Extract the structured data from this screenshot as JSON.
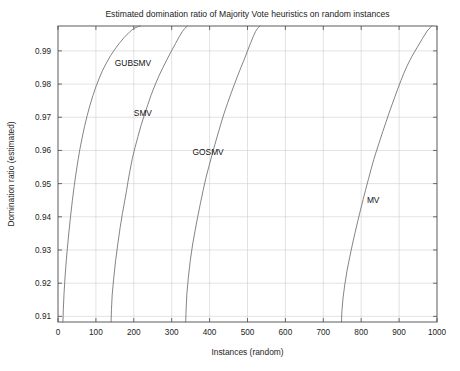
{
  "chart_data": {
    "type": "line",
    "title": "Estimated domination ratio of Majority Vote heuristics on random instances",
    "xlabel": "Instances (random)",
    "ylabel": "Domination ratio (estimated)",
    "xlim": [
      0,
      1000
    ],
    "ylim": [
      0.9083,
      0.9975
    ],
    "grid": true,
    "legend_position": "inline-annotations",
    "xticks": [
      0,
      100,
      200,
      300,
      400,
      500,
      600,
      700,
      800,
      900,
      1000
    ],
    "xtick_labels": [
      "0",
      "100",
      "200",
      "300",
      "400",
      "500",
      "600",
      "700",
      "800",
      "900",
      "1000"
    ],
    "yticks": [
      0.91,
      0.92,
      0.93,
      0.94,
      0.95,
      0.96,
      0.97,
      0.98,
      0.99
    ],
    "ytick_labels": [
      "0.91",
      "0.92",
      "0.93",
      "0.94",
      "0.95",
      "0.96",
      "0.97",
      "0.98",
      "0.99"
    ],
    "series": [
      {
        "name": "GUBSMV",
        "color": "#6e6e6e",
        "label_x": 150,
        "label_y": 0.9855,
        "x": [
          13,
          14,
          16,
          19,
          23,
          28,
          33,
          38,
          43,
          48,
          53,
          58,
          64,
          70,
          77,
          84,
          92,
          100,
          109,
          118,
          128,
          139,
          150,
          162,
          175,
          188,
          196,
          203,
          209,
          213,
          217
        ],
        "y": [
          0.9083,
          0.912,
          0.917,
          0.9225,
          0.9285,
          0.9345,
          0.94,
          0.945,
          0.9495,
          0.9535,
          0.9572,
          0.9605,
          0.964,
          0.9672,
          0.9705,
          0.9735,
          0.9765,
          0.9792,
          0.9818,
          0.9842,
          0.9864,
          0.9886,
          0.9905,
          0.9923,
          0.9941,
          0.9956,
          0.9964,
          0.9969,
          0.9972,
          0.9974,
          0.9975
        ]
      },
      {
        "name": "SMV",
        "color": "#636363",
        "label_x": 200,
        "label_y": 0.9705,
        "x": [
          140,
          141,
          143,
          147,
          152,
          158,
          164,
          170,
          176,
          181,
          185,
          190,
          196,
          203,
          211,
          219,
          228,
          237,
          246,
          256,
          266,
          277,
          288,
          299,
          310,
          320,
          328,
          334,
          338,
          341
        ],
        "y": [
          0.9083,
          0.912,
          0.9165,
          0.9215,
          0.9268,
          0.932,
          0.9368,
          0.941,
          0.9448,
          0.948,
          0.9508,
          0.954,
          0.9575,
          0.9608,
          0.9642,
          0.9675,
          0.9707,
          0.9738,
          0.9768,
          0.9797,
          0.9824,
          0.985,
          0.9875,
          0.9899,
          0.9922,
          0.9943,
          0.9958,
          0.9967,
          0.9972,
          0.9975
        ]
      },
      {
        "name": "GOSMV",
        "color": "#636363",
        "label_x": 355,
        "label_y": 0.9585,
        "x": [
          337,
          338,
          340,
          344,
          349,
          355,
          362,
          369,
          376,
          383,
          390,
          398,
          406,
          414,
          422,
          430,
          438,
          447,
          456,
          465,
          474,
          483,
          492,
          500,
          508,
          515,
          521,
          526,
          530,
          533
        ],
        "y": [
          0.9083,
          0.912,
          0.9168,
          0.9218,
          0.9268,
          0.9315,
          0.936,
          0.9402,
          0.9442,
          0.948,
          0.9516,
          0.9551,
          0.9585,
          0.9618,
          0.965,
          0.9681,
          0.9711,
          0.9741,
          0.977,
          0.9798,
          0.9825,
          0.9851,
          0.9876,
          0.99,
          0.9923,
          0.9943,
          0.9958,
          0.9967,
          0.9972,
          0.9975
        ]
      },
      {
        "name": "MV",
        "color": "#5f5f5f",
        "label_x": 815,
        "label_y": 0.9442,
        "x": [
          748,
          749,
          752,
          757,
          763,
          770,
          777,
          784,
          791,
          798,
          805,
          812,
          819,
          826,
          833,
          841,
          849,
          857,
          865,
          873,
          881,
          889,
          897,
          905,
          913,
          922,
          934,
          948,
          962,
          974,
          982,
          986
        ],
        "y": [
          0.9083,
          0.9115,
          0.9155,
          0.9198,
          0.924,
          0.928,
          0.9318,
          0.9353,
          0.9387,
          0.942,
          0.9452,
          0.9483,
          0.9513,
          0.9543,
          0.9572,
          0.9601,
          0.9629,
          0.9657,
          0.9684,
          0.9711,
          0.9737,
          0.9762,
          0.9787,
          0.9811,
          0.9834,
          0.9857,
          0.9884,
          0.9911,
          0.9938,
          0.996,
          0.997,
          0.9975
        ]
      }
    ]
  }
}
